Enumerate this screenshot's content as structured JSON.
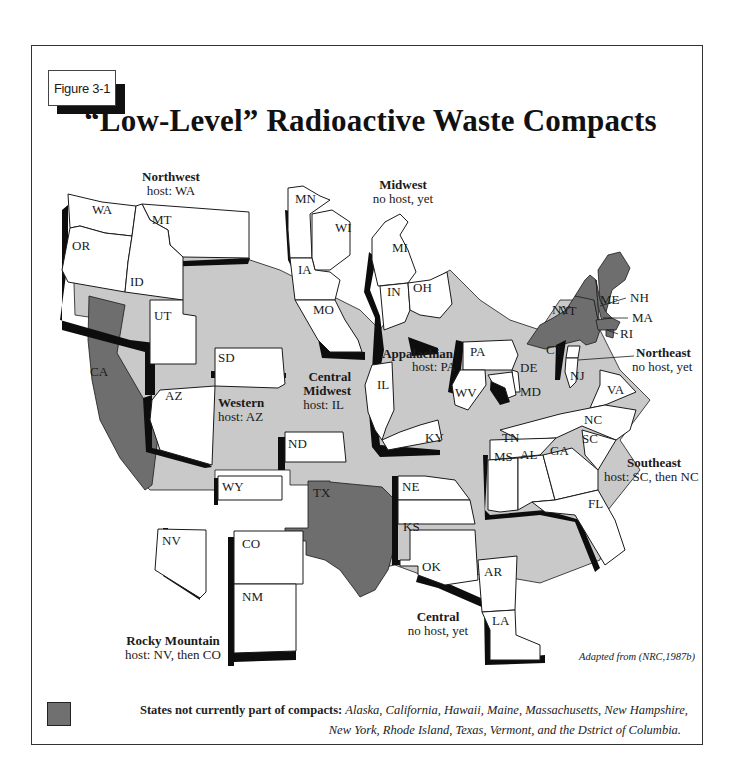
{
  "figure_label": "Figure 3-1",
  "title": "“Low-Level” Radioactive Waste Compacts",
  "colors": {
    "compact_state": "#ffffff",
    "unaffiliated_background": "#c9c9c9",
    "not_in_compact": "#6e6e6e",
    "compact_border_shadow": "#0d0d0d"
  },
  "compacts": [
    {
      "name": "Northwest",
      "host": "host: WA",
      "states": [
        "WA",
        "OR",
        "MT",
        "ID",
        "UT"
      ]
    },
    {
      "name": "Midwest",
      "host": "no host, yet",
      "states": [
        "MN",
        "WI",
        "IA",
        "MO",
        "MI",
        "IN",
        "OH"
      ]
    },
    {
      "name": "Western",
      "host": "host: AZ",
      "states": [
        "SD",
        "AZ"
      ]
    },
    {
      "name": "Central Midwest",
      "name_line1": "Central",
      "name_line2": "Midwest",
      "host": "host: IL",
      "states": [
        "IL",
        "KY"
      ]
    },
    {
      "name": "Appalachian",
      "host": "host: PA",
      "states": [
        "PA",
        "WV",
        "DE",
        "MD"
      ]
    },
    {
      "name": "Northeast",
      "host": "no host, yet",
      "states": [
        "CT",
        "NJ"
      ]
    },
    {
      "name": "Southeast",
      "host": "host: SC, then NC",
      "states": [
        "VA",
        "NC",
        "SC",
        "TN",
        "MS",
        "AL",
        "GA",
        "FL"
      ]
    },
    {
      "name": "Rocky Mountain",
      "host": "host: NV, then CO",
      "states": [
        "WY",
        "NV",
        "CO",
        "NM"
      ]
    },
    {
      "name": "Central",
      "host": "no host, yet",
      "states": [
        "NE",
        "KS",
        "OK",
        "AR",
        "LA"
      ]
    }
  ],
  "extra_state_labels": {
    "ND": "ND"
  },
  "not_in_compact_labels": [
    "CA",
    "TX",
    "NY",
    "VT",
    "ME",
    "NH",
    "MA",
    "RI"
  ],
  "state_labels": {
    "WA": "WA",
    "OR": "OR",
    "MT": "MT",
    "ID": "ID",
    "UT": "UT",
    "MN": "MN",
    "WI": "WI",
    "IA": "IA",
    "MO": "MO",
    "MI": "MI",
    "IN": "IN",
    "OH": "OH",
    "SD": "SD",
    "AZ": "AZ",
    "IL": "IL",
    "KY": "KY",
    "PA": "PA",
    "WV": "WV",
    "DE": "DE",
    "MD": "MD",
    "CT": "CT",
    "NJ": "NJ",
    "VA": "VA",
    "NC": "NC",
    "SC": "SC",
    "TN": "TN",
    "MS": "MS",
    "AL": "AL",
    "GA": "GA",
    "FL": "FL",
    "WY": "WY",
    "NV": "NV",
    "CO": "CO",
    "NM": "NM",
    "NE": "NE",
    "KS": "KS",
    "OK": "OK",
    "AR": "AR",
    "LA": "LA",
    "ND": "ND",
    "CA": "CA",
    "TX": "TX",
    "NY": "NY",
    "VT": "VT",
    "ME": "ME",
    "NH": "NH",
    "MA": "MA",
    "RI": "RI"
  },
  "source_note": "Adapted from (NRC,1987b)",
  "legend": {
    "label": "States not currently part of compacts:",
    "line1_list": "Alaska, California, Hawaii, Maine, Massachusetts, New Hampshire,",
    "line2_list": "New York, Rhode Island, Texas, Vermont, and the Dstrict of Columbia."
  }
}
